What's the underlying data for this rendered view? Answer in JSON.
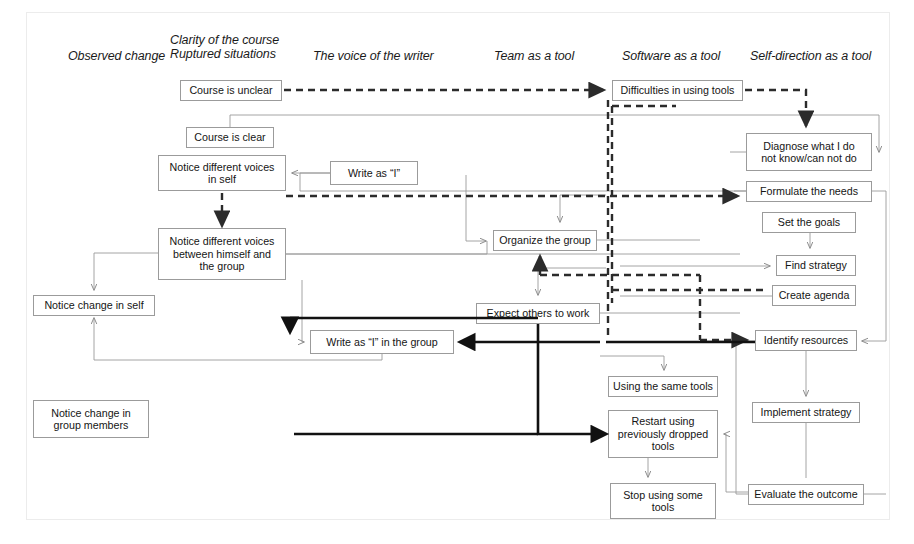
{
  "diagram": {
    "columns": [
      {
        "id": "observed-change",
        "label": "Observed change",
        "x": 68,
        "y": 56
      },
      {
        "id": "clarity-ruptured",
        "label": "Clarity of the course\nRuptured situations",
        "x": 170,
        "y": 39
      },
      {
        "id": "voice-of-writer",
        "label": "The voice of the writer",
        "x": 313,
        "y": 56
      },
      {
        "id": "team-as-a-tool",
        "label": "Team as a tool",
        "x": 494,
        "y": 56
      },
      {
        "id": "software-as-a-tool",
        "label": "Software as a tool",
        "x": 622,
        "y": 56
      },
      {
        "id": "self-direction-as-a-tool",
        "label": "Self-direction as a tool",
        "x": 750,
        "y": 56
      }
    ],
    "nodes": [
      {
        "id": "course-is-unclear",
        "label": "Course is unclear",
        "x": 180,
        "y": 80,
        "w": 102,
        "h": 21
      },
      {
        "id": "difficulties-using-tools",
        "label": "Difficulties in using tools",
        "x": 612,
        "y": 80,
        "w": 131,
        "h": 21
      },
      {
        "id": "course-is-clear",
        "label": "Course is clear",
        "x": 186,
        "y": 127,
        "w": 88,
        "h": 21
      },
      {
        "id": "diagnose-what-i-do",
        "label": "Diagnose what I do\nnot know/can not do",
        "x": 746,
        "y": 133,
        "w": 126,
        "h": 38
      },
      {
        "id": "notice-voices-in-self",
        "label": "Notice different voices\nin self",
        "x": 158,
        "y": 155,
        "w": 128,
        "h": 36
      },
      {
        "id": "write-as-i",
        "label": "Write as “I”",
        "x": 330,
        "y": 161,
        "w": 88,
        "h": 24
      },
      {
        "id": "formulate-the-needs",
        "label": "Formulate the needs",
        "x": 746,
        "y": 181,
        "w": 126,
        "h": 21
      },
      {
        "id": "set-the-goals",
        "label": "Set the goals",
        "x": 762,
        "y": 212,
        "w": 94,
        "h": 21
      },
      {
        "id": "notice-voices-group",
        "label": "Notice different voices\nbetween himself and\nthe group",
        "x": 158,
        "y": 228,
        "w": 128,
        "h": 52
      },
      {
        "id": "organize-the-group",
        "label": "Organize the group",
        "x": 493,
        "y": 230,
        "w": 104,
        "h": 21
      },
      {
        "id": "find-strategy",
        "label": "Find strategy",
        "x": 776,
        "y": 255,
        "w": 80,
        "h": 21
      },
      {
        "id": "create-agenda",
        "label": "Create agenda",
        "x": 772,
        "y": 285,
        "w": 84,
        "h": 21
      },
      {
        "id": "notice-change-in-self",
        "label": "Notice change in self",
        "x": 33,
        "y": 295,
        "w": 122,
        "h": 21
      },
      {
        "id": "expect-others-to-work",
        "label": "Expect others to work",
        "x": 476,
        "y": 303,
        "w": 124,
        "h": 21
      },
      {
        "id": "write-as-i-in-group",
        "label": "Write as “I” in the group",
        "x": 310,
        "y": 330,
        "w": 144,
        "h": 24
      },
      {
        "id": "identify-resources",
        "label": "Identify resources",
        "x": 755,
        "y": 330,
        "w": 102,
        "h": 21
      },
      {
        "id": "using-the-same-tools",
        "label": "Using the same tools",
        "x": 608,
        "y": 376,
        "w": 110,
        "h": 21
      },
      {
        "id": "notice-change-in-group",
        "label": "Notice change in\ngroup members",
        "x": 33,
        "y": 400,
        "w": 116,
        "h": 38
      },
      {
        "id": "implement-strategy",
        "label": "Implement strategy",
        "x": 752,
        "y": 402,
        "w": 108,
        "h": 21
      },
      {
        "id": "restart-using-dropped",
        "label": "Restart using\npreviously dropped\ntools",
        "x": 608,
        "y": 410,
        "w": 110,
        "h": 48
      },
      {
        "id": "evaluate-the-outcome",
        "label": "Evaluate the outcome",
        "x": 748,
        "y": 484,
        "w": 116,
        "h": 21
      },
      {
        "id": "stop-using-some-tools",
        "label": "Stop using some\ntools",
        "x": 610,
        "y": 483,
        "w": 106,
        "h": 36
      }
    ],
    "style": {
      "node_border_color": "#9b9b9b",
      "solid_edge_color": "#8c8c8c",
      "dashed_edge_color": "#2b2b2b",
      "thick_edge_color": "#111111",
      "frame_color": "#ececec",
      "background": "#ffffff",
      "text_color": "#151515"
    },
    "edge_kinds": [
      "solid-thin",
      "dashed-bold",
      "solid-thick"
    ]
  }
}
